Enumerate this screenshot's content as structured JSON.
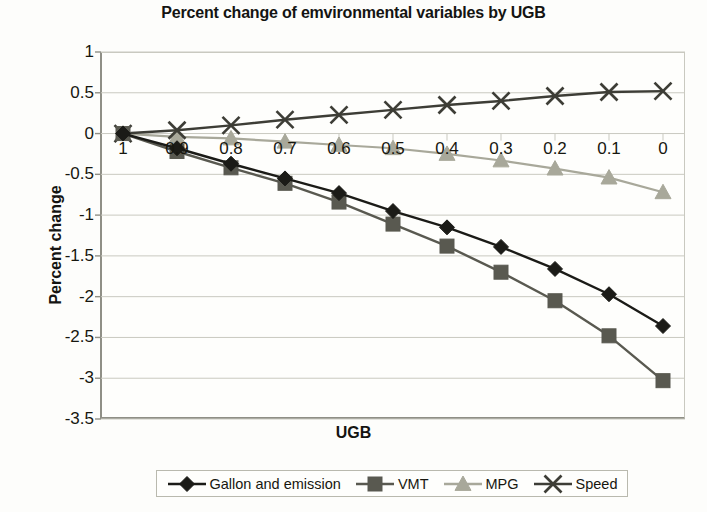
{
  "chart_data": {
    "type": "line",
    "title": "Percent change of emvironmental variables by UGB",
    "xlabel": "UGB",
    "ylabel": "Percent change",
    "categories": [
      "1",
      "0.9",
      "0.8",
      "0.7",
      "0.6",
      "0.5",
      "0.4",
      "0.3",
      "0.2",
      "0.1",
      "0"
    ],
    "yticks": [
      "1",
      "0.5",
      "0",
      "-0.5",
      "-1",
      "-1.5",
      "-2",
      "-2.5",
      "-3",
      "-3.5"
    ],
    "ylim": [
      -3.5,
      1
    ],
    "grid": true,
    "legend_position": "bottom",
    "series": [
      {
        "name": "Gallon and emission",
        "marker": "diamond",
        "color": "#1b1b17",
        "values": [
          0,
          -0.18,
          -0.37,
          -0.55,
          -0.73,
          -0.95,
          -1.15,
          -1.39,
          -1.66,
          -1.97,
          -2.36
        ]
      },
      {
        "name": "VMT",
        "marker": "square",
        "color": "#595950",
        "values": [
          0,
          -0.22,
          -0.42,
          -0.61,
          -0.84,
          -1.11,
          -1.38,
          -1.7,
          -2.05,
          -2.48,
          -3.03
        ]
      },
      {
        "name": "MPG",
        "marker": "triangle",
        "color": "#a8a89a",
        "values": [
          0,
          -0.04,
          -0.06,
          -0.1,
          -0.14,
          -0.18,
          -0.25,
          -0.33,
          -0.43,
          -0.54,
          -0.72
        ]
      },
      {
        "name": "Speed",
        "marker": "cross",
        "color": "#3d3d36",
        "values": [
          0,
          0.04,
          0.1,
          0.17,
          0.23,
          0.29,
          0.35,
          0.4,
          0.46,
          0.51,
          0.52
        ]
      }
    ]
  },
  "legend": {
    "items": [
      {
        "label": "Gallon and emission"
      },
      {
        "label": "VMT"
      },
      {
        "label": "MPG"
      },
      {
        "label": "Speed"
      }
    ]
  },
  "colors": {
    "gridline": "#c9c9c0",
    "axis": "#8f8f86",
    "background": "#fdfdfb",
    "text": "#17170f"
  }
}
